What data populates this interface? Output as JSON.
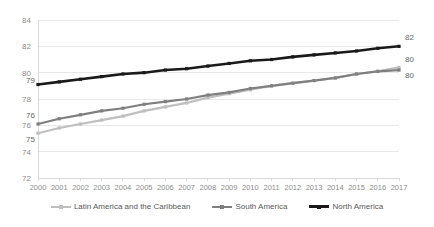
{
  "chart_data": {
    "type": "line",
    "title": "",
    "xlabel": "",
    "ylabel": "",
    "x": [
      2000,
      2001,
      2002,
      2003,
      2004,
      2005,
      2006,
      2007,
      2008,
      2009,
      2010,
      2011,
      2012,
      2013,
      2014,
      2015,
      2016,
      2017
    ],
    "categories": [
      "2000",
      "2001",
      "2002",
      "2003",
      "2004",
      "2005",
      "2006",
      "2007",
      "2008",
      "2009",
      "2010",
      "2011",
      "2012",
      "2013",
      "2014",
      "2015",
      "2016",
      "2017"
    ],
    "ylim": [
      72,
      84
    ],
    "yticks": [
      72,
      74,
      76,
      78,
      80,
      82,
      84
    ],
    "ytick_labels": [
      "72",
      "74",
      "76",
      "78",
      "80",
      "82",
      "84"
    ],
    "grid": true,
    "legend_position": "bottom",
    "series": [
      {
        "name": "Latin America and the Caribbean",
        "color": "#bfbfbf",
        "values": [
          75.4,
          75.8,
          76.1,
          76.4,
          76.7,
          77.1,
          77.4,
          77.7,
          78.1,
          78.4,
          78.7,
          79.0,
          79.2,
          79.4,
          79.6,
          79.9,
          80.1,
          80.4
        ],
        "start_label": "75",
        "end_label": "80"
      },
      {
        "name": "South America",
        "color": "#7f7f7f",
        "values": [
          76.1,
          76.5,
          76.8,
          77.1,
          77.3,
          77.6,
          77.8,
          78.0,
          78.3,
          78.5,
          78.8,
          79.0,
          79.2,
          79.4,
          79.6,
          79.9,
          80.1,
          80.2
        ],
        "start_label": "76",
        "end_label": "80"
      },
      {
        "name": "North America",
        "color": "#1a1a1a",
        "values": [
          79.1,
          79.3,
          79.5,
          79.7,
          79.9,
          80.0,
          80.2,
          80.3,
          80.5,
          80.7,
          80.9,
          81.0,
          81.2,
          81.35,
          81.5,
          81.65,
          81.85,
          82.0
        ],
        "start_label": "79",
        "end_label": "82"
      }
    ],
    "annotations": [
      {
        "text": "79",
        "series": "North America",
        "position": "start"
      },
      {
        "text": "82",
        "series": "North America",
        "position": "end"
      },
      {
        "text": "76",
        "series": "South America",
        "position": "start"
      },
      {
        "text": "80",
        "series": "South America",
        "position": "end"
      },
      {
        "text": "75",
        "series": "Latin America and the Caribbean",
        "position": "start"
      },
      {
        "text": "80",
        "series": "Latin America and the Caribbean",
        "position": "end"
      }
    ]
  },
  "legend": {
    "items": [
      {
        "label": "Latin America and the Caribbean",
        "color": "#bfbfbf"
      },
      {
        "label": "South America",
        "color": "#7f7f7f"
      },
      {
        "label": "North America",
        "color": "#1a1a1a"
      }
    ]
  },
  "colors": {
    "background": "#ffffff",
    "gridline": "#e8e8e8",
    "axis": "#d9d9d9",
    "tick_text": "#8c8c8c",
    "label_text": "#666666",
    "legend_text": "#595959"
  }
}
